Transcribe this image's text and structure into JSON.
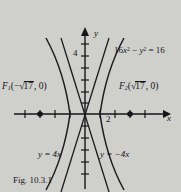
{
  "figure": {
    "caption": "Fig. 10.3.1",
    "equation_display": "16x² − y² = 16",
    "equation_parts": {
      "coef": "16",
      "x": "x",
      "sup2a": "2",
      "minus": " − ",
      "y": "y",
      "sup2b": "2",
      "equals": " = 16"
    },
    "axes": {
      "x_label": "x",
      "y_label": "y",
      "x_tick_label": "2",
      "y_tick_label": "4",
      "x_range": [
        -5,
        5
      ],
      "y_range": [
        -6,
        6
      ],
      "x_tick_spacing": 1,
      "y_tick_spacing": 1,
      "origin_px": [
        85,
        114
      ]
    },
    "foci": [
      {
        "name": "F1",
        "label_prefix": "F",
        "label_sub": "1",
        "open_paren": "(−",
        "radical": "√",
        "radicand": "17",
        "rest": ", 0)",
        "x_value": -4.123,
        "y_value": 0
      },
      {
        "name": "F2",
        "label_prefix": "F",
        "label_sub": "2",
        "open_paren": "(",
        "radical": "√",
        "radicand": "17",
        "rest": ", 0)",
        "x_value": 4.123,
        "y_value": 0
      }
    ],
    "asymptotes": [
      {
        "name": "left-asymptote",
        "label": "y = 4x",
        "slope": 4
      },
      {
        "name": "right-asymptote",
        "label": "y = −4x",
        "slope": -4
      }
    ],
    "curve": {
      "type": "hyperbola",
      "orientation": "horizontal-transverse",
      "a": 1,
      "b": 4,
      "c": 4.123,
      "vertices": [
        [
          -1,
          0
        ],
        [
          1,
          0
        ]
      ]
    },
    "colors": {
      "background": "#cfcfcc",
      "ink": "#15151a",
      "curve": "#1b1b20"
    }
  }
}
